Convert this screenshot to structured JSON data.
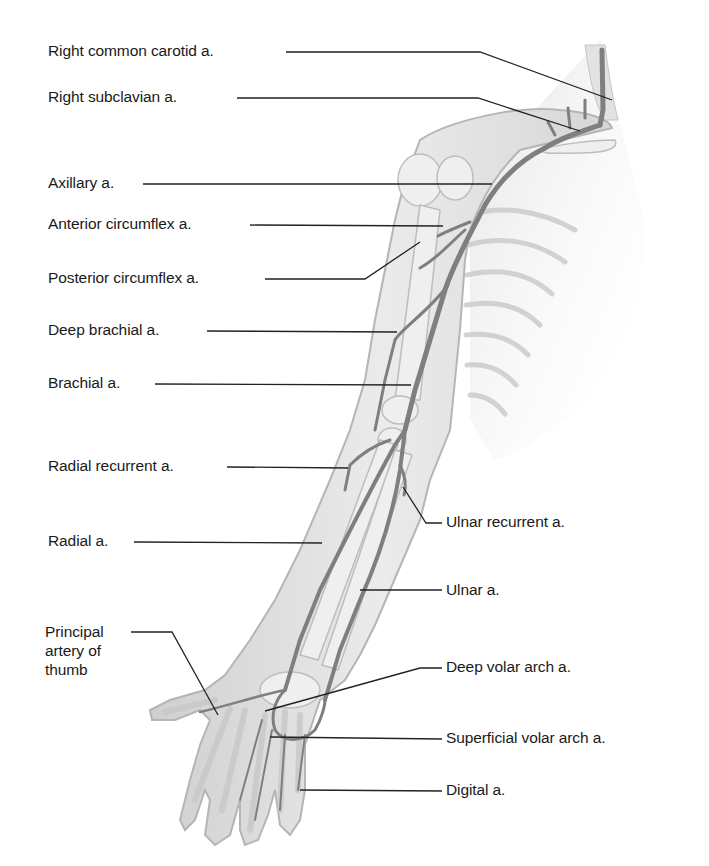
{
  "diagram": {
    "colors": {
      "background": "#ffffff",
      "label_text": "#1a1a1a",
      "leader_line": "#222222",
      "skin_fill": "#e4e4e4",
      "skin_outline": "#b8b8b8",
      "bone_fill": "#ececec",
      "artery": "#8a8a8a",
      "artery_dark": "#6e6e6e"
    },
    "labels_left": [
      {
        "id": "right-common-carotid",
        "text": "Right common carotid a."
      },
      {
        "id": "right-subclavian",
        "text": "Right subclavian a."
      },
      {
        "id": "axillary",
        "text": "Axillary a."
      },
      {
        "id": "anterior-circumflex",
        "text": "Anterior circumflex a."
      },
      {
        "id": "posterior-circumflex",
        "text": "Posterior circumflex a."
      },
      {
        "id": "deep-brachial",
        "text": "Deep brachial a."
      },
      {
        "id": "brachial",
        "text": "Brachial a."
      },
      {
        "id": "radial-recurrent",
        "text": "Radial recurrent a."
      },
      {
        "id": "radial",
        "text": "Radial a."
      },
      {
        "id": "principal-artery-thumb",
        "text": "Principal artery of thumb"
      }
    ],
    "labels_right": [
      {
        "id": "ulnar-recurrent",
        "text": "Ulnar recurrent a."
      },
      {
        "id": "ulnar",
        "text": "Ulnar a."
      },
      {
        "id": "deep-volar-arch",
        "text": "Deep volar arch a."
      },
      {
        "id": "superficial-volar-arch",
        "text": "Superficial volar arch a."
      },
      {
        "id": "digital",
        "text": "Digital a."
      }
    ]
  }
}
